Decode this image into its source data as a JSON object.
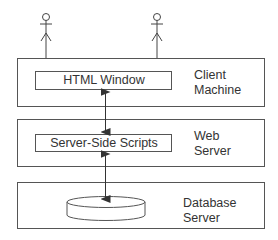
{
  "diagram": {
    "actors": [
      {
        "name": "user-1"
      },
      {
        "name": "user-2"
      }
    ],
    "tiers": [
      {
        "id": "client",
        "label_line1": "Client",
        "label_line2": "Machine",
        "component": "HTML Window"
      },
      {
        "id": "web",
        "label_line1": "Web",
        "label_line2": "Server",
        "component": "Server-Side Scripts"
      },
      {
        "id": "database",
        "label_line1": "Database",
        "label_line2": "Server",
        "component_icon": "database-cylinder-icon"
      }
    ],
    "connections": [
      {
        "from": "HTML Window",
        "to": "Server-Side Scripts",
        "type": "bidirectional-arrow"
      },
      {
        "from": "Server-Side Scripts",
        "to": "database",
        "type": "bidirectional-arrow"
      }
    ]
  }
}
